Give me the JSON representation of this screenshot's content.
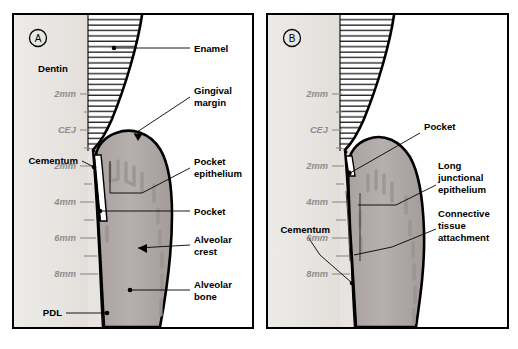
{
  "figure": {
    "background_color": "#ffffff",
    "border_color": "#000000"
  },
  "panels": [
    {
      "id": "A",
      "id_label": "A",
      "scale_labels": [
        "2mm",
        "CEJ",
        "2mm",
        "4mm",
        "6mm",
        "8mm"
      ],
      "tissue_labels": [
        {
          "name": "dentin",
          "text": "Dentin"
        },
        {
          "name": "enamel",
          "text": "Enamel"
        },
        {
          "name": "gingival-margin",
          "text": "Gingival\nmargin",
          "line1": "Gingival",
          "line2": "margin"
        },
        {
          "name": "pocket-epithelium",
          "text": "Pocket epithelium",
          "line1": "Pocket",
          "line2": "epithelium"
        },
        {
          "name": "cementum",
          "text": "Cementum"
        },
        {
          "name": "pocket",
          "text": "Pocket"
        },
        {
          "name": "alveolar-crest",
          "text": "Alveolar crest",
          "line1": "Alveolar",
          "line2": "crest"
        },
        {
          "name": "alveolar-bone",
          "text": "Alveolar bone",
          "line1": "Alveolar",
          "line2": "bone"
        },
        {
          "name": "pdl",
          "text": "PDL"
        }
      ]
    },
    {
      "id": "B",
      "id_label": "B",
      "scale_labels": [
        "2mm",
        "CEJ",
        "2mm",
        "4mm",
        "6mm",
        "8mm"
      ],
      "tissue_labels": [
        {
          "name": "pocket",
          "text": "Pocket"
        },
        {
          "name": "long-junctional-epithelium",
          "text": "Long junctional epithelium",
          "line1": "Long",
          "line2": "junctional",
          "line3": "epithelium"
        },
        {
          "name": "connective-tissue-attachment",
          "text": "Connective tissue attachment",
          "line1": "Connective",
          "line2": "tissue",
          "line3": "attachment"
        },
        {
          "name": "cementum",
          "text": "Cementum"
        }
      ]
    }
  ],
  "colors": {
    "gingiva_fill": "#b0aaa8",
    "gingiva_shade": "#9b9492",
    "dentin_fill": "#ebe9e6",
    "bone_fill": "#fcfbf9",
    "scale_text": "#8d8d8d",
    "outline": "#000000"
  },
  "caption": {
    "text": ""
  }
}
